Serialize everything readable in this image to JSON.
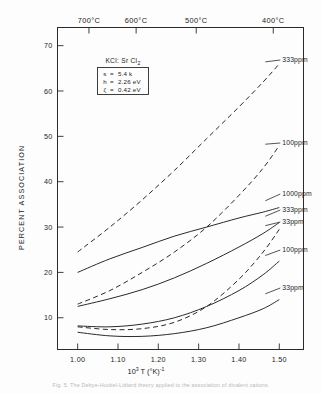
{
  "figure": {
    "caption": "Fig. 5.  The Debye-Huckel-Lidiard theory applied to the association of divalent cations.",
    "legend_box": {
      "title": "KCl: Sr Cl",
      "title_sub": "2",
      "rows": [
        {
          "symbol": "s",
          "eq": "=",
          "value": "5.4",
          "unit": "k"
        },
        {
          "symbol": "h",
          "eq": "=",
          "value": "2.26",
          "unit": "eV"
        },
        {
          "symbol": "ζ",
          "eq": "=",
          "value": "0.42",
          "unit": "eV"
        }
      ]
    }
  },
  "chart_data": {
    "type": "line",
    "title": "",
    "xlabel": "10³ T (°K)⁻¹",
    "ylabel": "PERCENT ASSOCIATION",
    "xlim": [
      0.95,
      1.56
    ],
    "ylim": [
      3,
      74
    ],
    "xticks": [
      "1.00",
      "1.10",
      "1.20",
      "1.30",
      "1.40",
      "1.50"
    ],
    "xtick_values": [
      1.0,
      1.1,
      1.2,
      1.3,
      1.4,
      1.5
    ],
    "yticks": [
      "10",
      "20",
      "30",
      "40",
      "50",
      "60",
      "70"
    ],
    "ytick_values": [
      10,
      20,
      30,
      40,
      50,
      60,
      70
    ],
    "grid": false,
    "legend_position": "right-inline",
    "secondary_xaxis": {
      "label": "Temperature",
      "ticks": [
        "700°C",
        "600°C",
        "500°C",
        "400°C"
      ],
      "tick_x_values": [
        1.028,
        1.145,
        1.294,
        1.485
      ]
    },
    "series": [
      {
        "name": "333ppm",
        "style": "dashed",
        "label": "333ppm",
        "x": [
          1.0,
          1.08,
          1.16,
          1.24,
          1.32,
          1.4,
          1.46,
          1.5
        ],
        "values": [
          24.5,
          30.0,
          36.0,
          42.5,
          49.5,
          56.5,
          62.0,
          66.0
        ]
      },
      {
        "name": "100ppm-dashed",
        "style": "dashed",
        "label": "100ppm",
        "x": [
          1.0,
          1.08,
          1.16,
          1.24,
          1.32,
          1.4,
          1.46,
          1.5
        ],
        "values": [
          13.0,
          16.0,
          20.0,
          24.5,
          30.0,
          37.0,
          43.0,
          48.0
        ]
      },
      {
        "name": "1000ppm",
        "style": "solid",
        "label": "1000ppm",
        "x": [
          1.0,
          1.08,
          1.16,
          1.24,
          1.32,
          1.4,
          1.46,
          1.5
        ],
        "values": [
          20.0,
          23.0,
          25.5,
          28.0,
          30.0,
          32.0,
          33.3,
          34.3
        ]
      },
      {
        "name": "333ppm-solid",
        "style": "solid",
        "label": "333ppm",
        "x": [
          1.0,
          1.08,
          1.16,
          1.24,
          1.32,
          1.4,
          1.46,
          1.5
        ],
        "values": [
          12.5,
          14.2,
          16.2,
          18.8,
          22.0,
          25.6,
          28.6,
          31.0
        ]
      },
      {
        "name": "33ppm-dashed",
        "style": "dashed",
        "label": "33ppm",
        "x": [
          1.0,
          1.08,
          1.16,
          1.24,
          1.32,
          1.4,
          1.46,
          1.5
        ],
        "values": [
          8.0,
          7.4,
          7.6,
          9.0,
          12.5,
          18.5,
          24.5,
          29.5
        ]
      },
      {
        "name": "100ppm-solid",
        "style": "solid",
        "label": "100ppm",
        "x": [
          1.0,
          1.08,
          1.16,
          1.24,
          1.32,
          1.4,
          1.46,
          1.5
        ],
        "values": [
          8.2,
          8.0,
          8.6,
          10.0,
          12.5,
          16.0,
          19.5,
          22.5
        ]
      },
      {
        "name": "33ppm-solid",
        "style": "solid",
        "label": "33ppm",
        "x": [
          1.0,
          1.08,
          1.16,
          1.24,
          1.32,
          1.4,
          1.46,
          1.5
        ],
        "values": [
          6.8,
          6.0,
          5.9,
          6.5,
          7.8,
          10.0,
          12.0,
          14.0
        ]
      }
    ]
  },
  "colors": {
    "ink": "#2a2a2a",
    "paper": "#fdfdfd",
    "caption": "#b9b9b9"
  }
}
